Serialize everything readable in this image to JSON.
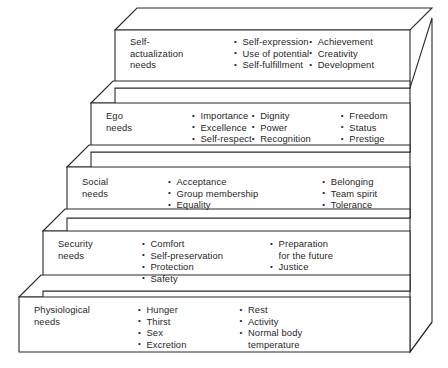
{
  "diagram": {
    "style": {
      "line_color": "#2b2b2b",
      "face_color": "#ffffff",
      "text_color": "#1f1f1f",
      "background": "#ffffff"
    },
    "tiers": [
      {
        "id": "self-actualization",
        "label": "Self-\nactualization\nneeds",
        "columns": [
          [
            "Self-expression",
            "Use of potential",
            "Self-fulfillment"
          ],
          [
            "Achievement",
            "Creativity",
            "Development"
          ]
        ]
      },
      {
        "id": "ego",
        "label": "Ego\nneeds",
        "columns": [
          [
            "Importance",
            "Excellence",
            "Self-respect"
          ],
          [
            "Dignity",
            "Power",
            "Recognition"
          ],
          [
            "Freedom",
            "Status",
            "Prestige"
          ]
        ]
      },
      {
        "id": "social",
        "label": "Social\nneeds",
        "columns": [
          [
            "Acceptance",
            "Group membership",
            "Equality"
          ],
          [
            "Belonging",
            "Team spirit",
            "Tolerance"
          ]
        ]
      },
      {
        "id": "security",
        "label": "Security\nneeds",
        "columns": [
          [
            "Comfort",
            "Self-preservation",
            "Protection",
            "Safety"
          ],
          [
            "Preparation\n for the future",
            "Justice"
          ]
        ]
      },
      {
        "id": "physiological",
        "label": "Physiological\nneeds",
        "columns": [
          [
            "Hunger",
            "Thirst",
            "Sex",
            "Excretion"
          ],
          [
            "Rest",
            "Activity",
            "Normal body\n temperature"
          ]
        ]
      }
    ]
  }
}
